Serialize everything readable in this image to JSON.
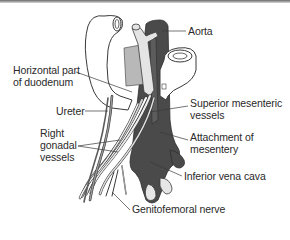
{
  "diagram": {
    "title": "",
    "labels": {
      "aorta": {
        "lines": [
          "Aorta"
        ]
      },
      "horizontal_duodenum": {
        "lines": [
          "Horizontal part",
          "of duodenum"
        ]
      },
      "ureter": {
        "lines": [
          "Ureter"
        ]
      },
      "superior_mesenteric": {
        "lines": [
          "Superior mesenteric",
          "vessels"
        ]
      },
      "right_gonadal": {
        "lines": [
          "Right",
          "gonadal",
          "vessels"
        ]
      },
      "attachment_mesentery": {
        "lines": [
          "Attachment of",
          "mesentery"
        ]
      },
      "inferior_vena_cava": {
        "lines": [
          "Inferior vena cava"
        ]
      },
      "genitofemoral": {
        "lines": [
          "Genitofemoral nerve"
        ]
      }
    },
    "colors": {
      "background": "#ffffff",
      "outline": "#3a3a3a",
      "dark_vessel": "#4a4a4a",
      "mid_gray": "#9a9a9a",
      "light_gray": "#cfcfcf",
      "text": "#2a2a2a"
    }
  }
}
